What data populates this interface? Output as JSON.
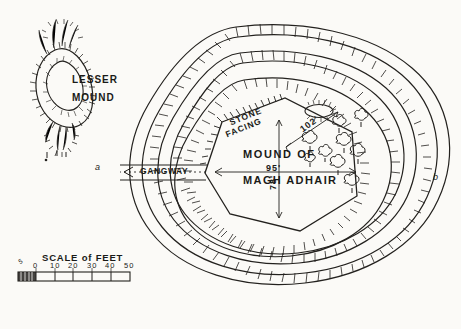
{
  "plate": {
    "kind": "archaeological site plan",
    "background_color": "#fbfaf7",
    "ink_color": "#23211e"
  },
  "labels": {
    "lesser_mound_line1": "LESSER",
    "lesser_mound_line2": "MOUND",
    "stone_facing_line1": "STONE",
    "stone_facing_line2": "FACING",
    "mound_of": "MOUND OF",
    "magh_adhair": "MAGH ADHAIR",
    "gangway": "GANGWAY",
    "point_a": "a",
    "point_b": "b"
  },
  "dimensions": {
    "diagonal": "102'",
    "horizontal": "95'",
    "vertical": "78'"
  },
  "scale": {
    "title": "SCALE of FEET",
    "ticks": [
      "0",
      "10",
      "20",
      "30",
      "40",
      "50"
    ],
    "lead_label": "5"
  },
  "features": {
    "summit_ring": "small oval depression on mound summit",
    "tree_count": 9,
    "rampart_rings": 3
  }
}
